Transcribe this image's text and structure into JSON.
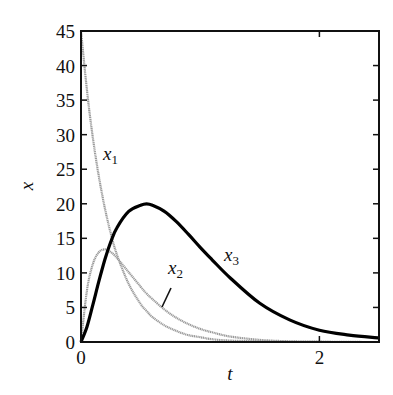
{
  "chart_data": {
    "type": "line",
    "title": "",
    "xlabel": "t",
    "ylabel": "x",
    "xlim": [
      0,
      2.5
    ],
    "ylim": [
      0,
      45
    ],
    "x_ticks": [
      0,
      2
    ],
    "x_tick_labels": [
      "0",
      "2"
    ],
    "y_ticks": [
      0,
      5,
      10,
      15,
      20,
      25,
      30,
      35,
      40,
      45
    ],
    "y_tick_labels": [
      "0",
      "5",
      "10",
      "15",
      "20",
      "25",
      "30",
      "35",
      "40",
      "45"
    ],
    "grid": false,
    "legend": "inline labels",
    "x": [
      0,
      0.05,
      0.1,
      0.15,
      0.2,
      0.25,
      0.3,
      0.4,
      0.5,
      0.55,
      0.6,
      0.7,
      0.8,
      0.9,
      1.0,
      1.1,
      1.25,
      1.5,
      1.75,
      2.0,
      2.25,
      2.5
    ],
    "series": [
      {
        "name": "x1",
        "label": "x",
        "subscript": "1",
        "color": "#9a9a9a",
        "width": 2.2,
        "values": [
          45,
          36.4,
          29.5,
          23.9,
          19.4,
          15.7,
          12.7,
          8.4,
          5.5,
          4.5,
          3.6,
          2.4,
          1.6,
          1.0,
          0.7,
          0.4,
          0.2,
          0.1,
          0.03,
          0.01,
          0.0,
          0.0
        ]
      },
      {
        "name": "x2",
        "label": "x",
        "subscript": "2",
        "color": "#9a9a9a",
        "width": 2.2,
        "values": [
          0,
          7.5,
          11.3,
          13.0,
          13.4,
          13.0,
          12.2,
          10.1,
          8.0,
          7.0,
          6.2,
          4.7,
          3.5,
          2.6,
          1.9,
          1.4,
          0.8,
          0.3,
          0.1,
          0.04,
          0.01,
          0.0
        ]
      },
      {
        "name": "x3",
        "label": "x",
        "subscript": "3",
        "color": "#000000",
        "width": 3.2,
        "values": [
          0,
          2.2,
          5.4,
          8.8,
          11.9,
          14.5,
          16.5,
          18.9,
          19.8,
          20.0,
          19.8,
          18.9,
          17.4,
          15.6,
          13.7,
          11.9,
          9.3,
          5.6,
          3.2,
          1.7,
          1.0,
          0.6
        ]
      }
    ],
    "annotations": [
      {
        "text": "x1",
        "t": 0.2,
        "x": 27,
        "points_to": "x1"
      },
      {
        "text": "x2",
        "t": 0.75,
        "x": 10.5,
        "points_to": "x2",
        "leader_line": true
      },
      {
        "text": "x3",
        "t": 1.2,
        "x": 12.5,
        "points_to": "x3"
      }
    ]
  }
}
